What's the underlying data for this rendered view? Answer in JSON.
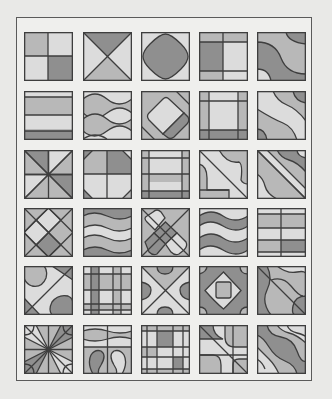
{
  "figure": {
    "columns": 5,
    "rows": 6,
    "colors": {
      "light": "#dcdcdc",
      "mid": "#b8b8b8",
      "dark": "#8f8f8f",
      "stroke": "#3e3e3e",
      "frame": "#5a5a5a",
      "background": "#e9e9e7"
    },
    "tiles": [
      {
        "row": 1,
        "col": 1,
        "pattern": "four-quadrants"
      },
      {
        "row": 1,
        "col": 2,
        "pattern": "x-diagonals"
      },
      {
        "row": 1,
        "col": 3,
        "pattern": "rounded-diamond"
      },
      {
        "row": 1,
        "col": 4,
        "pattern": "offset-grid"
      },
      {
        "row": 1,
        "col": 5,
        "pattern": "s-curve-bands"
      },
      {
        "row": 2,
        "col": 1,
        "pattern": "horizontal-bands"
      },
      {
        "row": 2,
        "col": 2,
        "pattern": "wavy-horizontal"
      },
      {
        "row": 2,
        "col": 3,
        "pattern": "rotated-rounded-square"
      },
      {
        "row": 2,
        "col": 4,
        "pattern": "border-grid"
      },
      {
        "row": 2,
        "col": 5,
        "pattern": "diagonal-waves"
      },
      {
        "row": 3,
        "col": 1,
        "pattern": "eight-wedges"
      },
      {
        "row": 3,
        "col": 2,
        "pattern": "cross-with-corner-cuts"
      },
      {
        "row": 3,
        "col": 3,
        "pattern": "double-border-grid"
      },
      {
        "row": 3,
        "col": 4,
        "pattern": "diagonal-with-curved-corners"
      },
      {
        "row": 3,
        "col": 5,
        "pattern": "diagonal-wavy-bands"
      },
      {
        "row": 4,
        "col": 1,
        "pattern": "diamond-lattice"
      },
      {
        "row": 4,
        "col": 2,
        "pattern": "wavy-stripes"
      },
      {
        "row": 4,
        "col": 3,
        "pattern": "rounded-diamond-lattice"
      },
      {
        "row": 4,
        "col": 4,
        "pattern": "wavy-lens-bands"
      },
      {
        "row": 4,
        "col": 5,
        "pattern": "plaid-blocks"
      },
      {
        "row": 5,
        "col": 1,
        "pattern": "diagonal-blobs"
      },
      {
        "row": 5,
        "col": 2,
        "pattern": "tartan-grid"
      },
      {
        "row": 5,
        "col": 3,
        "pattern": "x-with-side-arcs"
      },
      {
        "row": 5,
        "col": 4,
        "pattern": "concentric-rounded-squares"
      },
      {
        "row": 5,
        "col": 5,
        "pattern": "diagonal-wavy-overlap"
      },
      {
        "row": 6,
        "col": 1,
        "pattern": "star-with-corner-arcs"
      },
      {
        "row": 6,
        "col": 2,
        "pattern": "mirrored-loops"
      },
      {
        "row": 6,
        "col": 3,
        "pattern": "dense-plaid"
      },
      {
        "row": 6,
        "col": 4,
        "pattern": "diagonal-grid-curves"
      },
      {
        "row": 6,
        "col": 5,
        "pattern": "diagonal-wave-stripes"
      }
    ]
  }
}
